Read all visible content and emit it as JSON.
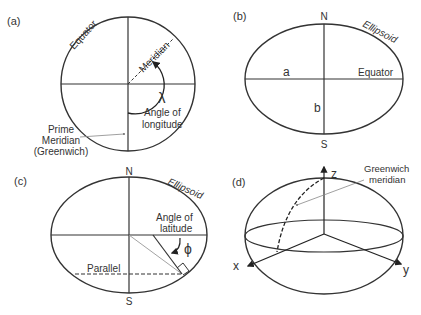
{
  "panels": {
    "a": {
      "tag": "(a)",
      "equator": "Equator",
      "meridian": "Meridian",
      "lambda": "λ",
      "angle_line1": "Angle of",
      "angle_line2": "longitude",
      "prime_line1": "Prime",
      "prime_line2": "Meridian",
      "prime_line3": "(Greenwich)"
    },
    "b": {
      "tag": "(b)",
      "north": "N",
      "south": "S",
      "ellipsoid": "Ellipsoid",
      "semi_major": "a",
      "semi_minor": "b",
      "equator": "Equator"
    },
    "c": {
      "tag": "(c)",
      "north": "N",
      "south": "S",
      "ellipsoid": "Ellipsoid",
      "angle_line1": "Angle of",
      "angle_line2": "latitude",
      "phi": "ϕ",
      "parallel": "Parallel"
    },
    "d": {
      "tag": "(d)",
      "z": "z",
      "x": "x",
      "y": "y",
      "greenwich_line1": "Greenwich",
      "greenwich_line2": "meridian"
    }
  },
  "colors": {
    "stroke": "#333333",
    "text": "#333333",
    "leader": "#888888"
  }
}
